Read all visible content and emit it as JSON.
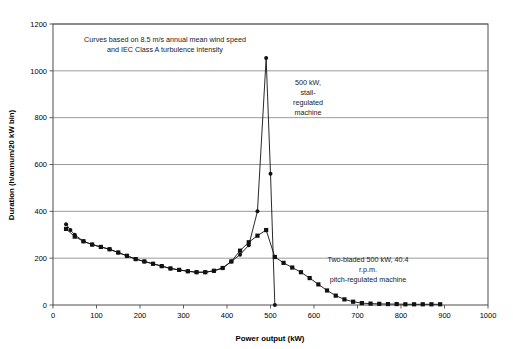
{
  "chart_data": {
    "type": "line",
    "title": "",
    "xlabel": "Power output (kW)",
    "ylabel": "Duration (h/annum/20 kW bin)",
    "xlim": [
      0,
      1000
    ],
    "ylim": [
      0,
      1200
    ],
    "xticks": [
      0,
      100,
      200,
      300,
      400,
      500,
      600,
      700,
      800,
      900,
      1000
    ],
    "yticks": [
      0,
      200,
      400,
      600,
      800,
      1000,
      1200
    ],
    "grid": "horizontal",
    "legend_position": "none",
    "annotations": [
      {
        "name": "assumptions-note",
        "lines": [
          "Curves based on 8.5 m/s annual mean wind speed",
          "and IEC Class A turbulence intensity"
        ]
      },
      {
        "name": "stall-machine-label",
        "lines": [
          "500 kW,",
          "stall-",
          "regulated",
          "machine"
        ]
      },
      {
        "name": "pitch-machine-label",
        "lines": [
          "Two-bladed 500 kW, 40.4",
          "r.p.m.",
          "pitch-regulated machine"
        ]
      }
    ],
    "series": [
      {
        "name": "500 kW, stall-regulated machine",
        "marker": "circle",
        "color": "#111111",
        "x": [
          30,
          40,
          50,
          70,
          90,
          110,
          130,
          150,
          170,
          190,
          210,
          230,
          250,
          270,
          290,
          310,
          330,
          350,
          370,
          390,
          410,
          430,
          450,
          470,
          490,
          500,
          510
        ],
        "y": [
          345,
          320,
          300,
          272,
          258,
          248,
          238,
          224,
          210,
          196,
          186,
          176,
          166,
          156,
          150,
          144,
          140,
          140,
          146,
          158,
          186,
          215,
          255,
          400,
          1055,
          560,
          0
        ]
      },
      {
        "name": "Two-bladed 500 kW, 40.4 r.p.m. pitch-regulated machine",
        "marker": "square",
        "color": "#111111",
        "x": [
          30,
          50,
          70,
          90,
          110,
          130,
          150,
          170,
          190,
          210,
          230,
          250,
          270,
          290,
          310,
          330,
          350,
          370,
          390,
          410,
          430,
          450,
          470,
          490,
          510,
          530,
          550,
          570,
          590,
          610,
          630,
          650,
          670,
          690,
          710,
          730,
          750,
          770,
          790,
          810,
          830,
          850,
          870,
          890
        ],
        "y": [
          325,
          292,
          272,
          258,
          248,
          238,
          224,
          210,
          196,
          186,
          176,
          166,
          156,
          150,
          144,
          140,
          140,
          146,
          158,
          186,
          232,
          268,
          296,
          320,
          205,
          180,
          160,
          140,
          115,
          88,
          62,
          40,
          24,
          14,
          8,
          6,
          5,
          4,
          4,
          3,
          3,
          3,
          3,
          3
        ]
      }
    ]
  }
}
